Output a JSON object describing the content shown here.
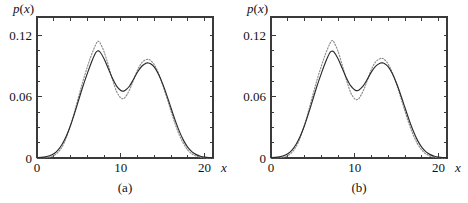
{
  "figure": {
    "background": "#ffffff",
    "ink_color": "#2b2b2b",
    "dotted_color": "#8d8d8d"
  },
  "chart_data": [
    {
      "type": "line",
      "panel": "(a)",
      "title": "",
      "xlabel": "x",
      "ylabel": "p(x)",
      "xlim": [
        0,
        21
      ],
      "ylim": [
        0,
        0.138
      ],
      "grid": false,
      "legend": null,
      "x_ticks_major": [
        0,
        10,
        20
      ],
      "x_tick_labels": [
        "0",
        "10",
        "20"
      ],
      "x_ticks_minor": [
        2,
        4,
        6,
        8,
        12,
        14,
        16,
        18
      ],
      "y_ticks_major": [
        0,
        0.06,
        0.12
      ],
      "y_tick_labels": [
        "0",
        "0.06",
        "0.12"
      ],
      "y_ticks_minor": [
        0.015,
        0.03,
        0.045,
        0.075,
        0.09,
        0.105
      ],
      "x": [
        0,
        0.5,
        1,
        1.5,
        2,
        2.5,
        3,
        3.5,
        4,
        4.5,
        5,
        5.5,
        6,
        6.5,
        7,
        7.25,
        7.5,
        8,
        8.5,
        9,
        9.5,
        10,
        10.25,
        10.5,
        11,
        11.5,
        12,
        12.5,
        13,
        13.25,
        13.5,
        14,
        14.5,
        15,
        15.5,
        16,
        16.5,
        17,
        17.5,
        18,
        18.5,
        19,
        19.5,
        20,
        20.5,
        21
      ],
      "series": [
        {
          "name": "solid",
          "style": "solid",
          "values": [
            0.0004,
            0.0006,
            0.0011,
            0.0022,
            0.0042,
            0.0078,
            0.0135,
            0.0215,
            0.0318,
            0.0441,
            0.0575,
            0.0707,
            0.0826,
            0.0938,
            0.103,
            0.1048,
            0.104,
            0.0972,
            0.0876,
            0.078,
            0.0704,
            0.066,
            0.0655,
            0.066,
            0.07,
            0.0768,
            0.0842,
            0.0898,
            0.0927,
            0.093,
            0.0925,
            0.089,
            0.082,
            0.0724,
            0.061,
            0.0487,
            0.0366,
            0.0258,
            0.017,
            0.0104,
            0.006,
            0.0033,
            0.0017,
            0.0009,
            0.0005,
            0.0003
          ]
        },
        {
          "name": "dotted",
          "style": "dotted",
          "values": [
            0.0001,
            0.0002,
            0.0004,
            0.001,
            0.0024,
            0.0055,
            0.011,
            0.0198,
            0.0318,
            0.046,
            0.0611,
            0.0757,
            0.089,
            0.101,
            0.1108,
            0.114,
            0.113,
            0.104,
            0.091,
            0.077,
            0.065,
            0.0588,
            0.0582,
            0.0592,
            0.066,
            0.076,
            0.0862,
            0.0932,
            0.0962,
            0.0965,
            0.0958,
            0.0912,
            0.0828,
            0.0716,
            0.0588,
            0.0456,
            0.033,
            0.0222,
            0.0138,
            0.0078,
            0.004,
            0.0019,
            0.0008,
            0.0003,
            0.0001,
            0.0
          ]
        }
      ]
    },
    {
      "type": "line",
      "panel": "(b)",
      "title": "",
      "xlabel": "x",
      "ylabel": "p(x)",
      "xlim": [
        0,
        21
      ],
      "ylim": [
        0,
        0.138
      ],
      "grid": false,
      "legend": null,
      "x_ticks_major": [
        0,
        10,
        20
      ],
      "x_tick_labels": [
        "0",
        "10",
        "20"
      ],
      "x_ticks_minor": [
        2,
        4,
        6,
        8,
        12,
        14,
        16,
        18
      ],
      "y_ticks_major": [
        0,
        0.06,
        0.12
      ],
      "y_tick_labels": [
        "0",
        "0.06",
        "0.12"
      ],
      "y_ticks_minor": [
        0.015,
        0.03,
        0.045,
        0.075,
        0.09,
        0.105
      ],
      "x": [
        0,
        0.5,
        1,
        1.5,
        2,
        2.5,
        3,
        3.5,
        4,
        4.5,
        5,
        5.5,
        6,
        6.5,
        7,
        7.25,
        7.5,
        8,
        8.5,
        9,
        9.5,
        10,
        10.25,
        10.5,
        11,
        11.5,
        12,
        12.5,
        13,
        13.25,
        13.5,
        14,
        14.5,
        15,
        15.5,
        16,
        16.5,
        17,
        17.5,
        18,
        18.5,
        19,
        19.5,
        20,
        20.5,
        21
      ],
      "series": [
        {
          "name": "solid",
          "style": "solid",
          "values": [
            0.0004,
            0.0006,
            0.0011,
            0.0022,
            0.0042,
            0.0078,
            0.0135,
            0.0215,
            0.0318,
            0.0441,
            0.0575,
            0.0707,
            0.0826,
            0.0938,
            0.1028,
            0.1045,
            0.1038,
            0.0972,
            0.0878,
            0.0784,
            0.0708,
            0.0665,
            0.066,
            0.0666,
            0.0706,
            0.0772,
            0.0845,
            0.09,
            0.0928,
            0.0931,
            0.0926,
            0.0892,
            0.0822,
            0.0726,
            0.0612,
            0.0489,
            0.0367,
            0.0259,
            0.017,
            0.0104,
            0.006,
            0.0033,
            0.0017,
            0.0009,
            0.0005,
            0.0003
          ]
        },
        {
          "name": "dotted",
          "style": "dotted",
          "values": [
            0.0001,
            0.0002,
            0.0004,
            0.001,
            0.0024,
            0.0056,
            0.0112,
            0.0202,
            0.0324,
            0.0468,
            0.062,
            0.0766,
            0.0898,
            0.1018,
            0.1115,
            0.1148,
            0.1136,
            0.1044,
            0.091,
            0.0764,
            0.0642,
            0.0578,
            0.0572,
            0.0584,
            0.0656,
            0.0762,
            0.087,
            0.0942,
            0.0972,
            0.0975,
            0.0966,
            0.0918,
            0.0832,
            0.0718,
            0.0588,
            0.0454,
            0.0328,
            0.022,
            0.0136,
            0.0077,
            0.0039,
            0.0018,
            0.0008,
            0.0003,
            0.0001,
            0.0
          ]
        }
      ]
    }
  ]
}
